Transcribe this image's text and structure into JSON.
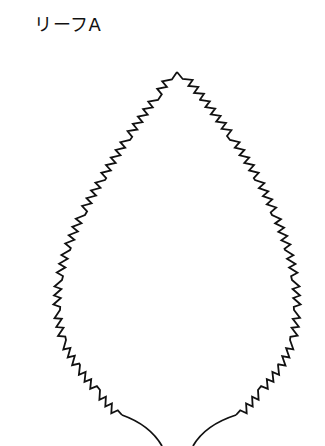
{
  "title": "リーフA",
  "leaf": {
    "stroke": "#111111",
    "stroke_width": 1.8,
    "apex": [
      177,
      72
    ],
    "left_outline": [
      [
        177,
        72
      ],
      [
        158,
        100
      ],
      [
        130,
        140
      ],
      [
        105,
        180
      ],
      [
        85,
        215
      ],
      [
        70,
        250
      ],
      [
        62,
        280
      ],
      [
        60,
        310
      ],
      [
        66,
        340
      ],
      [
        80,
        365
      ],
      [
        100,
        390
      ],
      [
        122,
        415
      ]
    ],
    "right_outline": [
      [
        177,
        72
      ],
      [
        200,
        100
      ],
      [
        230,
        140
      ],
      [
        255,
        180
      ],
      [
        272,
        215
      ],
      [
        285,
        250
      ],
      [
        292,
        280
      ],
      [
        294,
        310
      ],
      [
        290,
        340
      ],
      [
        278,
        365
      ],
      [
        258,
        390
      ],
      [
        236,
        415
      ]
    ],
    "left_stem": [
      [
        122,
        415
      ],
      [
        150,
        425
      ],
      [
        162,
        446
      ]
    ],
    "right_stem": [
      [
        236,
        415
      ],
      [
        205,
        425
      ],
      [
        193,
        446
      ]
    ],
    "tooth_spacing": 9,
    "tooth_depth": 7
  }
}
